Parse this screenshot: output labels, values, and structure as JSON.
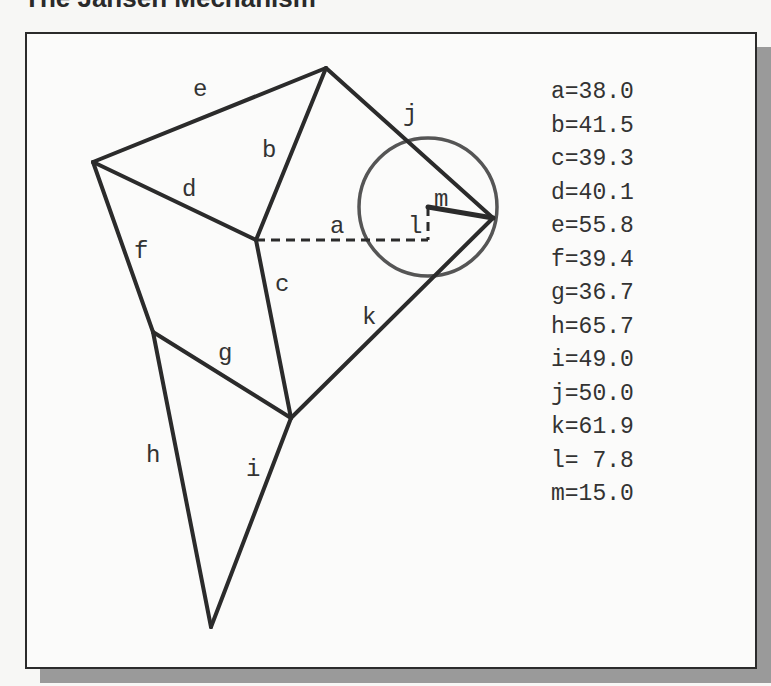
{
  "title": "The Jansen Mechanism",
  "diagram": {
    "labels": {
      "a": "a",
      "b": "b",
      "c": "c",
      "d": "d",
      "e": "e",
      "f": "f",
      "g": "g",
      "h": "h",
      "i": "i",
      "j": "j",
      "k": "k",
      "l": "l",
      "m": "m"
    },
    "colors": {
      "link": "#2b2b2b",
      "crank_circle": "#555555",
      "frame_shadow": "#9a9a9a"
    }
  },
  "legend": [
    {
      "key": "a",
      "text": "a=38.0",
      "value": 38.0
    },
    {
      "key": "b",
      "text": "b=41.5",
      "value": 41.5
    },
    {
      "key": "c",
      "text": "c=39.3",
      "value": 39.3
    },
    {
      "key": "d",
      "text": "d=40.1",
      "value": 40.1
    },
    {
      "key": "e",
      "text": "e=55.8",
      "value": 55.8
    },
    {
      "key": "f",
      "text": "f=39.4",
      "value": 39.4
    },
    {
      "key": "g",
      "text": "g=36.7",
      "value": 36.7
    },
    {
      "key": "h",
      "text": "h=65.7",
      "value": 65.7
    },
    {
      "key": "i",
      "text": "i=49.0",
      "value": 49.0
    },
    {
      "key": "j",
      "text": "j=50.0",
      "value": 50.0
    },
    {
      "key": "k",
      "text": "k=61.9",
      "value": 61.9
    },
    {
      "key": "l",
      "text": "l= 7.8",
      "value": 7.8
    },
    {
      "key": "m",
      "text": "m=15.0",
      "value": 15.0
    }
  ]
}
